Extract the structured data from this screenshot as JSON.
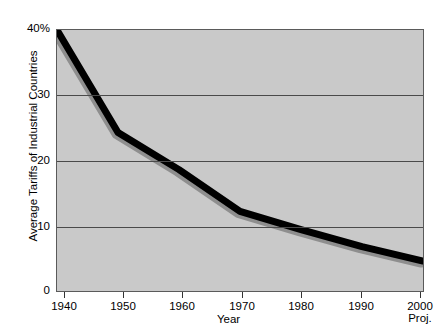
{
  "chart_data": {
    "type": "line",
    "title": "",
    "xlabel": "Year",
    "ylabel": "Average Tariffs of Industrial Countries",
    "xlim": [
      1940,
      2000
    ],
    "ylim": [
      0,
      40
    ],
    "grid": true,
    "legend": null,
    "x": [
      1940,
      1950,
      1960,
      1970,
      1980,
      1990,
      2000
    ],
    "values": [
      40,
      24.3,
      18.6,
      12.2,
      9.4,
      6.8,
      4.6
    ],
    "series": [
      {
        "name": "Average Tariffs of Industrial Countries",
        "values": [
          40,
          24.3,
          18.6,
          12.2,
          9.4,
          6.8,
          4.6
        ],
        "color": "#000000"
      }
    ],
    "y_ticks": [
      "40%",
      "30",
      "20",
      "10",
      "0"
    ],
    "y_tick_values": [
      40,
      30,
      20,
      10,
      0
    ],
    "x_ticks": [
      "1940",
      "1950",
      "1960",
      "1970",
      "1980",
      "1990",
      "2000"
    ],
    "x_last_tick_note": "Proj.",
    "plot_background_color": "#c9c9c9",
    "line_color": "#000000",
    "shadow_color": "#8e8e8e"
  },
  "axes": {
    "y_title": "Average Tariffs of Industrial Countries",
    "x_title": "Year",
    "y_tick_labels": [
      {
        "text": "40%",
        "value": 40
      },
      {
        "text": "30",
        "value": 30
      },
      {
        "text": "20",
        "value": 20
      },
      {
        "text": "10",
        "value": 10
      },
      {
        "text": "0",
        "value": 0
      }
    ],
    "x_tick_labels": [
      {
        "text": "1940",
        "sub": "",
        "value": 1940
      },
      {
        "text": "1950",
        "sub": "",
        "value": 1950
      },
      {
        "text": "1960",
        "sub": "",
        "value": 1960
      },
      {
        "text": "1970",
        "sub": "",
        "value": 1970
      },
      {
        "text": "1980",
        "sub": "",
        "value": 1980
      },
      {
        "text": "1990",
        "sub": "",
        "value": 1990
      },
      {
        "text": "2000",
        "sub": "Proj.",
        "value": 2000
      }
    ]
  }
}
